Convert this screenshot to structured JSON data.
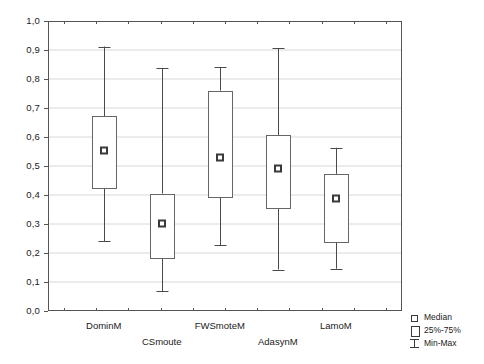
{
  "chart_data": {
    "type": "box",
    "title": "",
    "xlabel": "",
    "ylabel": "",
    "ylim": [
      0.0,
      1.0
    ],
    "y_tick_step": 0.1,
    "grid": true,
    "decimal_separator": ",",
    "y_ticks": [
      "1,0",
      "0,9",
      "0,8",
      "0,7",
      "0,6",
      "0,5",
      "0,4",
      "0,3",
      "0,2",
      "0,1",
      "0,0"
    ],
    "y_tick_values": [
      1.0,
      0.9,
      0.8,
      0.7,
      0.6,
      0.5,
      0.4,
      0.3,
      0.2,
      0.1,
      0.0
    ],
    "categories": [
      "DominM",
      "CSmoute",
      "FWSmoteM",
      "AdasynM",
      "LamoM"
    ],
    "boxes": [
      {
        "label": "DominM",
        "min": 0.24,
        "q1": 0.425,
        "median": 0.555,
        "q3": 0.672,
        "max": 0.912,
        "label_row": 0
      },
      {
        "label": "CSmoute",
        "min": 0.068,
        "q1": 0.186,
        "median": 0.305,
        "q3": 0.405,
        "max": 0.838,
        "label_row": 1
      },
      {
        "label": "FWSmoteM",
        "min": 0.227,
        "q1": 0.395,
        "median": 0.532,
        "q3": 0.76,
        "max": 0.84,
        "label_row": 0
      },
      {
        "label": "AdasynM",
        "min": 0.143,
        "q1": 0.356,
        "median": 0.493,
        "q3": 0.607,
        "max": 0.906,
        "label_row": 1
      },
      {
        "label": "LamoM",
        "min": 0.146,
        "q1": 0.24,
        "median": 0.388,
        "q3": 0.473,
        "max": 0.563,
        "label_row": 0
      }
    ],
    "legend": {
      "position": "bottom-right",
      "entries": [
        {
          "symbol": "median-marker-icon",
          "label": "Median"
        },
        {
          "symbol": "box-icon",
          "label": "25%-75%"
        },
        {
          "symbol": "minmax-whisker-icon",
          "label": "Min-Max"
        }
      ]
    },
    "colors": {
      "frame": "#555555",
      "grid": "#d8d8d8",
      "box_stroke": "#666666",
      "box_fill": "#ffffff",
      "whisker": "#4a4a4a",
      "median_stroke": "#3a3a3a",
      "background": "#ffffff",
      "text": "#1a1a1a"
    }
  }
}
